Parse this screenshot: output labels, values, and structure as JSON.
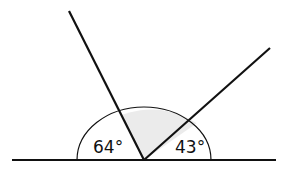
{
  "diagram": {
    "type": "angles-on-a-straight-line",
    "angles": [
      {
        "name": "left-angle",
        "value": 64,
        "label": "64°"
      },
      {
        "name": "right-angle",
        "value": 43,
        "label": "43°"
      },
      {
        "name": "shaded-angle",
        "value": null,
        "label": ""
      }
    ],
    "colors": {
      "line": "#111111",
      "shade": "#ebebeb",
      "background": "#ffffff"
    }
  }
}
